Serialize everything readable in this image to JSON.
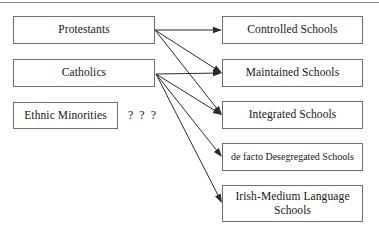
{
  "diagram": {
    "style": {
      "box_border_color": "#6f6f6f",
      "box_fill_color": "#ffffff",
      "text_color": "#171717",
      "arrow_color": "#2b2b2b",
      "rule_color": "#8f8f8f"
    },
    "source_nodes": [
      {
        "id": "protestants",
        "label": "Protestants",
        "x": 13,
        "y": 16,
        "w": 142,
        "h": 28,
        "anchor_x": 155,
        "anchor_y": 30
      },
      {
        "id": "catholics",
        "label": "Catholics",
        "x": 13,
        "y": 59,
        "w": 142,
        "h": 28,
        "anchor_x": 156,
        "anchor_y": 74
      },
      {
        "id": "ethnic-minorities",
        "label": "Ethnic Minorities",
        "x": 13,
        "y": 102,
        "w": 105,
        "h": 27,
        "anchor_x": 118,
        "anchor_y": 115
      }
    ],
    "unknown_marker": {
      "text": "? ? ?",
      "x": 128,
      "y": 108
    },
    "target_nodes": [
      {
        "id": "controlled-schools",
        "label": "Controlled Schools",
        "x": 222,
        "y": 16,
        "w": 141,
        "h": 28,
        "anchor_x": 222,
        "anchor_y": 30,
        "small": false
      },
      {
        "id": "maintained-schools",
        "label": "Maintained Schools",
        "x": 222,
        "y": 59,
        "w": 141,
        "h": 28,
        "anchor_x": 222,
        "anchor_y": 73,
        "small": false
      },
      {
        "id": "integrated-schools",
        "label": "Integrated Schools",
        "x": 222,
        "y": 101,
        "w": 141,
        "h": 28,
        "anchor_x": 222,
        "anchor_y": 115,
        "small": false
      },
      {
        "id": "de-facto-desegregated-schools",
        "label": "de facto Desegregated Schools",
        "x": 222,
        "y": 143,
        "w": 141,
        "h": 28,
        "anchor_x": 222,
        "anchor_y": 157,
        "small": true
      },
      {
        "id": "irish-medium-language-schools",
        "label": "Irish-Medium Language\nSchools",
        "x": 222,
        "y": 185,
        "w": 141,
        "h": 37,
        "anchor_x": 222,
        "anchor_y": 203,
        "small": false
      }
    ],
    "edges": [
      {
        "id": "protestants-to-controlled",
        "from": "protestants",
        "to": "controlled-schools"
      },
      {
        "id": "protestants-to-maintained",
        "from": "protestants",
        "to": "maintained-schools"
      },
      {
        "id": "protestants-to-integrated",
        "from": "protestants",
        "to": "integrated-schools"
      },
      {
        "id": "catholics-to-maintained",
        "from": "catholics",
        "to": "maintained-schools"
      },
      {
        "id": "catholics-to-integrated",
        "from": "catholics",
        "to": "integrated-schools"
      },
      {
        "id": "catholics-to-de-facto",
        "from": "catholics",
        "to": "de-facto-desegregated-schools"
      },
      {
        "id": "catholics-to-irish-medium",
        "from": "catholics",
        "to": "irish-medium-language-schools"
      }
    ]
  }
}
